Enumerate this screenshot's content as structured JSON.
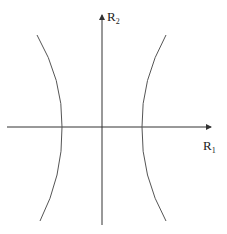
{
  "diagram": {
    "type": "hyperbola-plot",
    "axes": {
      "horizontal": {
        "label_main": "R",
        "label_sub": "1"
      },
      "vertical": {
        "label_main": "R",
        "label_sub": "2"
      }
    },
    "colors": {
      "background": "#ffffff",
      "axis": "#333333",
      "curve": "#555555",
      "text": "#222222"
    },
    "curves": [
      {
        "name": "left-branch",
        "points": [
          [
            37,
            35
          ],
          [
            62,
            127
          ],
          [
            40,
            221
          ]
        ]
      },
      {
        "name": "right-branch",
        "points": [
          [
            166,
            35
          ],
          [
            142,
            127
          ],
          [
            166,
            221
          ]
        ]
      }
    ]
  }
}
